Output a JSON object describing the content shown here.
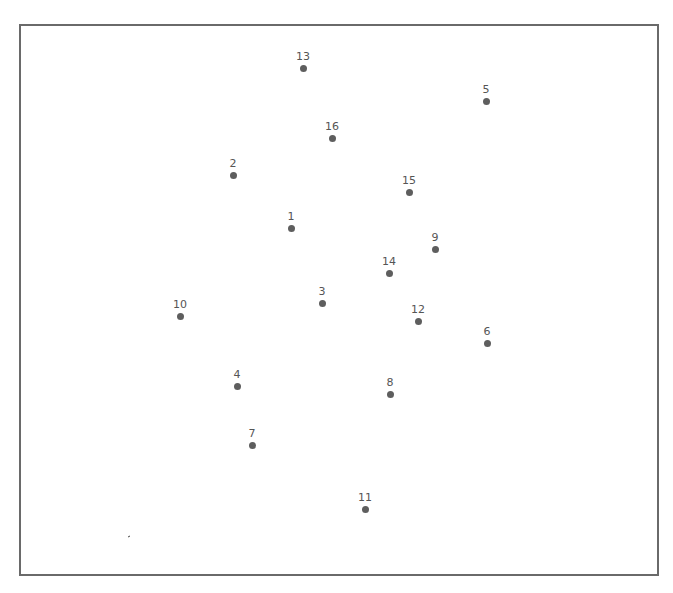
{
  "chart_data": {
    "type": "scatter",
    "title": "",
    "xlabel": "",
    "ylabel": "",
    "grid": false,
    "legend": null,
    "axes_visible": false,
    "frame": {
      "left": 19,
      "top": 24,
      "right": 657,
      "bottom": 574
    },
    "point_color": "#5e5e5e",
    "points": [
      {
        "label": "1",
        "x": 291,
        "y": 228
      },
      {
        "label": "2",
        "x": 233,
        "y": 175
      },
      {
        "label": "3",
        "x": 322,
        "y": 303
      },
      {
        "label": "4",
        "x": 237,
        "y": 386
      },
      {
        "label": "5",
        "x": 486,
        "y": 101
      },
      {
        "label": "6",
        "x": 487,
        "y": 343
      },
      {
        "label": "7",
        "x": 252,
        "y": 445
      },
      {
        "label": "8",
        "x": 390,
        "y": 394
      },
      {
        "label": "9",
        "x": 435,
        "y": 249
      },
      {
        "label": "10",
        "x": 180,
        "y": 316
      },
      {
        "label": "11",
        "x": 365,
        "y": 509
      },
      {
        "label": "12",
        "x": 418,
        "y": 321
      },
      {
        "label": "13",
        "x": 303,
        "y": 68
      },
      {
        "label": "14",
        "x": 389,
        "y": 273
      },
      {
        "label": "15",
        "x": 409,
        "y": 192
      },
      {
        "label": "16",
        "x": 332,
        "y": 138
      }
    ]
  }
}
